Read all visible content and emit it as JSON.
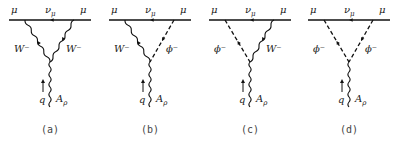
{
  "figure": {
    "panels": [
      {
        "id": "a",
        "caption": "(a)",
        "left_line": "W⁻",
        "right_line": "W⁻",
        "left_type": "wavy",
        "right_type": "wavy"
      },
      {
        "id": "b",
        "caption": "(b)",
        "left_line": "W⁻",
        "right_line": "ϕ⁻",
        "left_type": "wavy",
        "right_type": "dashed"
      },
      {
        "id": "c",
        "caption": "(c)",
        "left_line": "ϕ⁻",
        "right_line": "W⁻",
        "left_type": "dashed",
        "right_type": "wavy"
      },
      {
        "id": "d",
        "caption": "(d)",
        "left_line": "ϕ⁻",
        "right_line": "ϕ⁻",
        "left_type": "dashed",
        "right_type": "dashed"
      }
    ],
    "labels": {
      "muon": "μ",
      "neutrino": "ν",
      "neutrino_sub": "μ",
      "momentum": "q",
      "photon": "A",
      "photon_sub": "ρ",
      "momentum_arrow": "↑"
    }
  }
}
